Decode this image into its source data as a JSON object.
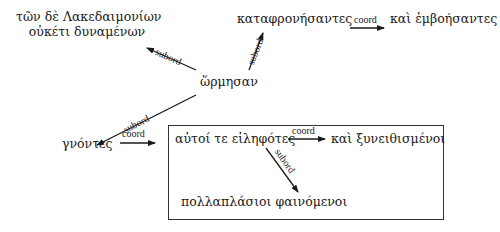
{
  "diagram": {
    "nodes": {
      "root": "ὥρμησαν",
      "lak_line1": "τῶν δὲ Λακεδαιμονίων",
      "lak_line2": "οὐκέτι δυναμένων",
      "kataphron": "καταφρονήσαντες",
      "emboesantes": "καὶ ἐμβοήσαντες",
      "gnontes": "γνόντες",
      "eilephotes": "αὐτοί τε εἰληφότες",
      "xyneith": "καὶ ξυνειθισμένοι",
      "pollaplasioi": "πολλαπλάσιοι φαινόμενοι"
    },
    "edges": [
      {
        "from": "root",
        "to": "lak",
        "label": "subord"
      },
      {
        "from": "root",
        "to": "kataphron",
        "label": "subord"
      },
      {
        "from": "kataphron",
        "to": "emboesantes",
        "label": "coord"
      },
      {
        "from": "root",
        "to": "gnontes",
        "label": "subord"
      },
      {
        "from": "gnontes",
        "to": "eilephotes_box",
        "label": "coord"
      },
      {
        "from": "eilephotes",
        "to": "xyneith",
        "label": "coord"
      },
      {
        "from": "eilephotes",
        "to": "pollaplasioi",
        "label": "subord"
      }
    ],
    "labels": {
      "subord": "subord",
      "coord": "coord"
    }
  }
}
